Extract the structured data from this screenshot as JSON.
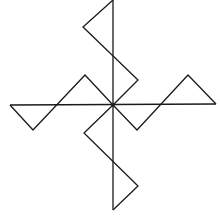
{
  "diagram": {
    "type": "geometric-figure",
    "stroke_color": "#1a1a1a",
    "background": "#ffffff",
    "center": [
      113,
      105
    ],
    "axes": {
      "vertical": [
        [
          113,
          0
        ],
        [
          113,
          210
        ]
      ],
      "horizontal": [
        [
          10,
          105
        ],
        [
          216,
          104
        ]
      ]
    },
    "arms": [
      {
        "name": "top",
        "path": [
          [
            113,
            0
          ],
          [
            83,
            27
          ],
          [
            138,
            80
          ],
          [
            113,
            105
          ]
        ]
      },
      {
        "name": "right",
        "path": [
          [
            113,
            105
          ],
          [
            137,
            130
          ],
          [
            188,
            75
          ],
          [
            216,
            104
          ]
        ]
      },
      {
        "name": "bottom",
        "path": [
          [
            113,
            105
          ],
          [
            84,
            133
          ],
          [
            138,
            186
          ],
          [
            113,
            210
          ]
        ]
      },
      {
        "name": "left",
        "path": [
          [
            10,
            105
          ],
          [
            33,
            130
          ],
          [
            85,
            75
          ],
          [
            113,
            105
          ]
        ]
      }
    ]
  }
}
